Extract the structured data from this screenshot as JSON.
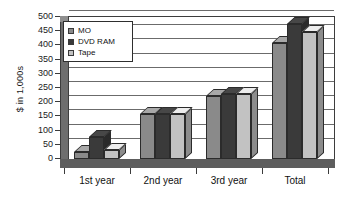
{
  "chart_data": {
    "type": "bar",
    "title": "",
    "subtitle": "",
    "xlabel": "",
    "ylabel": "$ in 1,000s",
    "categories": [
      "1st year",
      "2nd year",
      "3rd year",
      "Total"
    ],
    "series": [
      {
        "name": "MO",
        "color": "#8a8a8a",
        "values": [
          25,
          158,
          222,
          410
        ]
      },
      {
        "name": "DVD RAM",
        "color": "#3a3a3a",
        "values": [
          78,
          160,
          228,
          477
        ]
      },
      {
        "name": "Tape",
        "color": "#c2c2c2",
        "values": [
          32,
          157,
          230,
          447
        ]
      }
    ],
    "ylim": [
      0,
      500
    ],
    "ytick_values": [
      0,
      50,
      100,
      150,
      200,
      250,
      300,
      350,
      400,
      450,
      500
    ],
    "ytick_labels": [
      "0",
      "50",
      "100",
      "150",
      "200",
      "250",
      "300",
      "350",
      "400",
      "450",
      "500"
    ],
    "grid": true,
    "legend_position": "top-left",
    "style": "3d-grayscale"
  },
  "legend": {
    "items": [
      {
        "label": "MO",
        "color": "#8a8a8a"
      },
      {
        "label": "DVD RAM",
        "color": "#3a3a3a"
      },
      {
        "label": "Tape",
        "color": "#c2c2c2"
      }
    ]
  },
  "colors": {
    "mo": "#8a8a8a",
    "dvd_ram": "#3a3a3a",
    "tape": "#c2c2c2",
    "axis": "#3b3b3b",
    "grid": "#6b6b6b",
    "background": "#ffffff"
  }
}
